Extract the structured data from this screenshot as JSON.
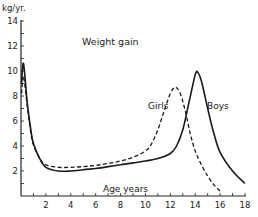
{
  "chart_data": {
    "type": "line",
    "title": "Weight gain",
    "xlabel": "Age years",
    "ylabel": "kg/yr.",
    "xlim": [
      0,
      18
    ],
    "ylim": [
      0,
      14
    ],
    "x_ticks": [
      "2",
      "4",
      "6",
      "8",
      "10",
      "12",
      "14",
      "16",
      "18"
    ],
    "y_ticks": [
      "2",
      "4",
      "6",
      "8",
      "10",
      "12",
      "14"
    ],
    "grid": false,
    "legend_position": "inline labels near peaks",
    "series": [
      {
        "name": "Boys",
        "style": "solid",
        "points": [
          [
            0.05,
            9.0
          ],
          [
            0.2,
            10.6
          ],
          [
            0.5,
            7.5
          ],
          [
            0.8,
            5.2
          ],
          [
            1.0,
            4.2
          ],
          [
            1.5,
            3.0
          ],
          [
            2,
            2.3
          ],
          [
            3,
            2.0
          ],
          [
            4,
            2.0
          ],
          [
            5,
            2.1
          ],
          [
            6,
            2.2
          ],
          [
            7,
            2.35
          ],
          [
            8,
            2.5
          ],
          [
            9,
            2.65
          ],
          [
            10,
            2.8
          ],
          [
            11,
            3.0
          ],
          [
            12,
            3.4
          ],
          [
            12.5,
            4.0
          ],
          [
            13,
            5.3
          ],
          [
            13.5,
            7.5
          ],
          [
            14,
            9.7
          ],
          [
            14.2,
            9.9
          ],
          [
            14.5,
            9.2
          ],
          [
            15,
            7.0
          ],
          [
            15.5,
            5.0
          ],
          [
            16,
            3.5
          ],
          [
            17,
            2.0
          ],
          [
            18,
            1.0
          ]
        ]
      },
      {
        "name": "Girls",
        "style": "dashed",
        "points": [
          [
            0.05,
            8.2
          ],
          [
            0.2,
            9.6
          ],
          [
            0.5,
            7.2
          ],
          [
            0.8,
            5.0
          ],
          [
            1.0,
            4.1
          ],
          [
            1.5,
            3.0
          ],
          [
            2,
            2.5
          ],
          [
            3,
            2.3
          ],
          [
            4,
            2.3
          ],
          [
            5,
            2.35
          ],
          [
            6,
            2.45
          ],
          [
            7,
            2.6
          ],
          [
            8,
            2.8
          ],
          [
            9,
            3.1
          ],
          [
            10,
            3.6
          ],
          [
            10.5,
            4.2
          ],
          [
            11,
            5.3
          ],
          [
            11.5,
            6.8
          ],
          [
            12,
            8.2
          ],
          [
            12.4,
            8.7
          ],
          [
            12.8,
            8.2
          ],
          [
            13.2,
            6.8
          ],
          [
            13.6,
            5.0
          ],
          [
            14,
            3.6
          ],
          [
            14.5,
            2.5
          ],
          [
            15,
            1.6
          ],
          [
            15.5,
            0.9
          ],
          [
            16,
            0.4
          ]
        ]
      }
    ]
  },
  "labels": {
    "unit": "kg/yr.",
    "title": "Weight gain",
    "girls": "Girls",
    "boys": "Boys",
    "xlabel": "Age years"
  }
}
